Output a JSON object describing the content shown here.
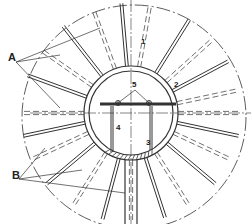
{
  "diagram": {
    "type": "engineering-cross-section",
    "center": [
      131,
      113
    ],
    "outer_circle_radius": 112,
    "outer_circle_style": "dash-dot",
    "inner_ring": {
      "outer_radius": 47,
      "inner_radius": 42
    },
    "stroke_color": "#333333",
    "background": "#ffffff",
    "rib_angles_solid_deg": [
      -95,
      -58,
      -28,
      12,
      40,
      72,
      105,
      140,
      168,
      200,
      232
    ],
    "rib_angles_dashed_deg": [
      -80,
      -42,
      -12,
      0,
      25,
      58,
      90,
      122,
      155,
      180,
      215,
      250
    ],
    "labels": [
      {
        "id": "A",
        "text": "A",
        "x": 8,
        "y": 57,
        "size": "big"
      },
      {
        "id": "B",
        "text": "B",
        "x": 12,
        "y": 175,
        "size": "big"
      },
      {
        "id": "1",
        "text": "1",
        "x": 141,
        "y": 40,
        "size": "small"
      },
      {
        "id": "2",
        "text": "2",
        "x": 174,
        "y": 84,
        "size": "small"
      },
      {
        "id": "3",
        "text": "3",
        "x": 146,
        "y": 142,
        "size": "small"
      },
      {
        "id": "4",
        "text": "4",
        "x": 116,
        "y": 127,
        "size": "small"
      },
      {
        "id": "5",
        "text": "5",
        "x": 132,
        "y": 83,
        "size": "small"
      }
    ],
    "leaders": {
      "A": [
        [
          16,
          62,
          100,
          28
        ],
        [
          16,
          62,
          60,
          55
        ],
        [
          16,
          62,
          60,
          108
        ]
      ],
      "B": [
        [
          19,
          179,
          45,
          148
        ],
        [
          19,
          179,
          82,
          170
        ],
        [
          19,
          179,
          125,
          193
        ]
      ],
      "5": [
        [
          135,
          90,
          118,
          103
        ],
        [
          135,
          90,
          149,
          103
        ]
      ]
    },
    "crossbar": {
      "y": 104,
      "x1": 100,
      "x2": 176
    },
    "bolts": [
      [
        118,
        103
      ],
      [
        149,
        103
      ]
    ],
    "posts": [
      {
        "x": 112,
        "y1": 106,
        "y2": 152
      },
      {
        "x": 151,
        "y1": 106,
        "y2": 150
      }
    ]
  }
}
